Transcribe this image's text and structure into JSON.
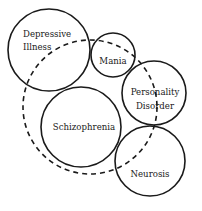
{
  "diagram": {
    "type": "overlapping-circles",
    "nodes": [
      {
        "id": "depressive",
        "lines": [
          "Depressive",
          "Illness"
        ],
        "cx": 49,
        "cy": 50,
        "r": 41
      },
      {
        "id": "mania",
        "lines": [
          "Mania"
        ],
        "cx": 113,
        "cy": 55,
        "r": 22
      },
      {
        "id": "personality",
        "lines": [
          "Personality",
          "Disorder"
        ],
        "cx": 154,
        "cy": 93,
        "r": 32
      },
      {
        "id": "schizophrenia",
        "lines": [
          "Schizophrenia"
        ],
        "cx": 81,
        "cy": 127,
        "r": 40
      },
      {
        "id": "neurosis",
        "lines": [
          "Neurosis"
        ],
        "cx": 150,
        "cy": 161,
        "r": 35
      }
    ],
    "enclosing_dashed_circle": {
      "cx": 90,
      "cy": 107,
      "r": 67
    },
    "colors": {
      "stroke": "#1a1a1a",
      "background": "#ffffff"
    }
  }
}
